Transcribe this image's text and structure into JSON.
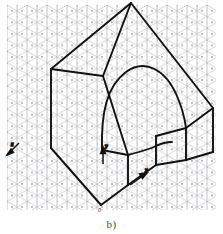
{
  "figure": {
    "caption": "b)",
    "type": "isometric-technical-drawing",
    "canvas": {
      "width": 223,
      "height": 234
    },
    "colors": {
      "background": "#ffffff",
      "grid_line": "#b9b9be",
      "grid_node": "#8f8f96",
      "object_outline": "#111111",
      "axis_arrow": "#111111",
      "caption_text": "#4a4a4a"
    },
    "grid": {
      "style": "isometric-triangular",
      "spacing_px": 10,
      "angle_deg": 30,
      "area": {
        "x": 7,
        "y": 5,
        "width": 209,
        "height": 205
      }
    },
    "axes": [
      {
        "name": "z-axis",
        "label": "z",
        "label_x": 12,
        "label_y": 146,
        "from_x": 19,
        "from_y": 144,
        "to_x": 5,
        "to_y": 157
      },
      {
        "name": "y-axis",
        "label": "y",
        "label_x": 106,
        "label_y": 148,
        "from_x": 103,
        "from_y": 163,
        "to_x": 103,
        "to_y": 148
      },
      {
        "name": "x-axis",
        "label": "x",
        "label_x": 146,
        "label_y": 172,
        "from_x": 130,
        "from_y": 185,
        "to_x": 146,
        "to_y": 174
      }
    ],
    "origin": {
      "label": "0",
      "x": 101,
      "y": 207
    },
    "outline_paths": [
      {
        "name": "top-face",
        "points": "51,69 129,24 147,15 131,3"
      },
      {
        "name": "back-right-edge",
        "points": "131,3 213,108"
      },
      {
        "name": "right-step",
        "points": "213,108 213,152"
      },
      {
        "name": "front-slope",
        "points": "103,76 51,69"
      },
      {
        "name": "left-vertical",
        "points": "51,69 51,148"
      },
      {
        "name": "bottom-left",
        "points": "51,148 101,205"
      },
      {
        "name": "bottom-front",
        "points": "101,205 128,185"
      },
      {
        "name": "front-right-vertical",
        "points": "128,185 128,155"
      }
    ],
    "arch": {
      "name": "semicircular-arch-slot",
      "apex_x": 131,
      "apex_y": 70,
      "left_foot_x": 102,
      "left_foot_y": 150,
      "right_foot_x": 186,
      "right_foot_y": 128
    }
  }
}
